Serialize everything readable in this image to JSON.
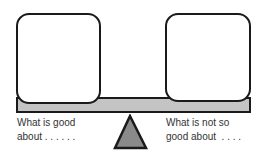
{
  "diagram": {
    "type": "balance-scale",
    "left_pan": {
      "label_line1": "What is good",
      "label_line2": "about . . . . . ."
    },
    "right_pan": {
      "label_line1": "What is not so",
      "label_line2": "good about  . . . ."
    },
    "colors": {
      "outline": "#1a1a1a",
      "beam_fill": "#c4c4c4",
      "fulcrum_fill": "#8a8a8a",
      "box_fill": "#ffffff",
      "text": "#333333"
    }
  }
}
